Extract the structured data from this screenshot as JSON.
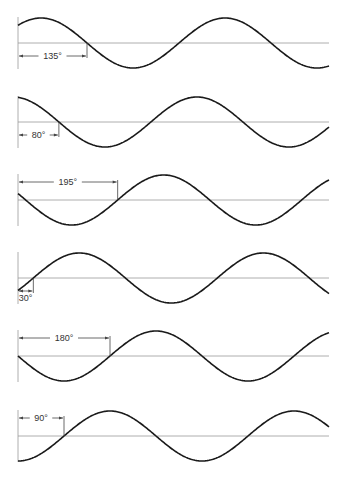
{
  "figure": {
    "colors": {
      "background": "#ffffff",
      "wave": "#1a1a1a",
      "axis": "#9a9a9a",
      "dimension": "#444444"
    },
    "geometry": {
      "x_start": 18,
      "x_end": 329,
      "period_px": 184,
      "amplitude_px": 25
    },
    "panels": [
      {
        "label": "135°",
        "phase_deg": 135,
        "midline_y": 43,
        "crossing_direction": "down",
        "label_position": "below"
      },
      {
        "label": "80°",
        "phase_deg": 80,
        "midline_y": 122,
        "crossing_direction": "down",
        "label_position": "below"
      },
      {
        "label": "195°",
        "phase_deg": 195,
        "midline_y": 200,
        "crossing_direction": "up",
        "label_position": "above"
      },
      {
        "label": "30°",
        "phase_deg": 30,
        "midline_y": 278,
        "crossing_direction": "up",
        "label_position": "below"
      },
      {
        "label": "180°",
        "phase_deg": 180,
        "midline_y": 356,
        "crossing_direction": "up",
        "label_position": "above"
      },
      {
        "label": "90°",
        "phase_deg": 90,
        "midline_y": 436,
        "crossing_direction": "up",
        "label_position": "above"
      }
    ]
  }
}
